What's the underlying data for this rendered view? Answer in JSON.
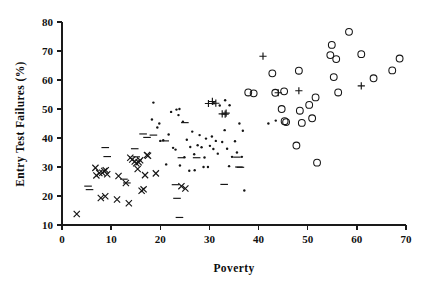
{
  "chart_data": {
    "type": "scatter",
    "title": "",
    "xlabel": "Poverty",
    "ylabel": "Entry Test Failures (%)",
    "xlim": [
      0,
      70
    ],
    "ylim": [
      10,
      80
    ],
    "xticks": [
      0,
      10,
      20,
      30,
      40,
      50,
      60,
      70
    ],
    "yticks": [
      10,
      20,
      30,
      40,
      50,
      60,
      70,
      80
    ],
    "xtick_labels": [
      "0",
      "10",
      "20",
      "30",
      "40",
      "50",
      "60",
      "70"
    ],
    "ytick_labels": [
      "10",
      "20",
      "30",
      "40",
      "50",
      "60",
      "70",
      "80"
    ],
    "grid": false,
    "legend": "none",
    "series": [
      {
        "name": "cross-group",
        "marker": "x",
        "values": [
          [
            3.0,
            13.8
          ],
          [
            6.8,
            29.7
          ],
          [
            7.0,
            27.1
          ],
          [
            7.6,
            27.9
          ],
          [
            7.9,
            19.3
          ],
          [
            8.2,
            28.0
          ],
          [
            8.6,
            28.6
          ],
          [
            8.8,
            19.9
          ],
          [
            8.9,
            28.9
          ],
          [
            9.2,
            27.5
          ],
          [
            11.2,
            18.8
          ],
          [
            11.5,
            26.9
          ],
          [
            13.0,
            24.5
          ],
          [
            13.6,
            17.5
          ],
          [
            13.9,
            33.2
          ],
          [
            14.3,
            32.6
          ],
          [
            14.8,
            31.9
          ],
          [
            15.1,
            31.3
          ],
          [
            15.4,
            29.3
          ],
          [
            15.6,
            31.6
          ],
          [
            15.9,
            32.3
          ],
          [
            16.2,
            21.8
          ],
          [
            16.6,
            22.3
          ],
          [
            16.9,
            27.2
          ],
          [
            17.3,
            34.1
          ],
          [
            17.5,
            33.9
          ],
          [
            19.1,
            27.8
          ],
          [
            25.1,
            22.6
          ],
          [
            24.3,
            23.4
          ]
        ]
      },
      {
        "name": "dash-group",
        "marker": "dash",
        "values": [
          [
            5.3,
            23.4
          ],
          [
            5.6,
            22.2
          ],
          [
            8.8,
            36.7
          ],
          [
            9.2,
            33.6
          ],
          [
            12.6,
            25.8
          ],
          [
            13.2,
            24.5
          ],
          [
            14.8,
            36.3
          ],
          [
            15.1,
            33.5
          ],
          [
            16.5,
            41.4
          ],
          [
            17.3,
            40.2
          ],
          [
            18.6,
            41.0
          ],
          [
            23.1,
            23.9
          ],
          [
            23.4,
            19.2
          ],
          [
            23.9,
            12.6
          ],
          [
            24.3,
            33.2
          ],
          [
            25.0,
            45.3
          ],
          [
            27.4,
            33.2
          ],
          [
            33.0,
            24.0
          ],
          [
            35.6,
            33.4
          ],
          [
            36.3,
            29.9
          ],
          [
            36.0,
            30.0
          ],
          [
            21.0,
            39.0
          ]
        ]
      },
      {
        "name": "dot-group",
        "marker": "dot",
        "values": [
          [
            18.6,
            52.2
          ],
          [
            18.3,
            46.4
          ],
          [
            19.4,
            43.6
          ],
          [
            20.0,
            39.0
          ],
          [
            20.6,
            39.2
          ],
          [
            21.2,
            30.9
          ],
          [
            21.7,
            41.2
          ],
          [
            22.6,
            36.6
          ],
          [
            23.3,
            49.8
          ],
          [
            23.7,
            47.9
          ],
          [
            23.9,
            50.0
          ],
          [
            24.6,
            45.6
          ],
          [
            24.9,
            33.4
          ],
          [
            25.4,
            39.4
          ],
          [
            25.9,
            28.7
          ],
          [
            26.5,
            42.2
          ],
          [
            26.9,
            34.4
          ],
          [
            27.6,
            37.5
          ],
          [
            28.0,
            41.0
          ],
          [
            28.4,
            36.8
          ],
          [
            28.8,
            30.0
          ],
          [
            29.3,
            39.8
          ],
          [
            29.7,
            30.0
          ],
          [
            30.1,
            37.3
          ],
          [
            30.5,
            40.5
          ],
          [
            30.8,
            36.2
          ],
          [
            31.3,
            39.0
          ],
          [
            31.7,
            34.6
          ],
          [
            32.1,
            51.2
          ],
          [
            32.6,
            38.6
          ],
          [
            33.1,
            42.7
          ],
          [
            33.6,
            36.3
          ],
          [
            34.1,
            51.3
          ],
          [
            34.6,
            33.5
          ],
          [
            35.2,
            38.9
          ],
          [
            35.6,
            35.0
          ],
          [
            36.1,
            45.0
          ],
          [
            36.8,
            42.5
          ],
          [
            37.1,
            21.9
          ],
          [
            36.6,
            33.5
          ],
          [
            22.2,
            49.0
          ],
          [
            23.1,
            36.0
          ],
          [
            19.8,
            45.0
          ],
          [
            26.1,
            36.9
          ],
          [
            29.0,
            33.3
          ],
          [
            30.9,
            52.0
          ],
          [
            33.2,
            53.0
          ],
          [
            34.0,
            30.3
          ],
          [
            24.0,
            30.5
          ],
          [
            27.0,
            28.9
          ],
          [
            42.0,
            45.0
          ],
          [
            43.5,
            46.0
          ]
        ]
      },
      {
        "name": "plus-group",
        "marker": "plus",
        "values": [
          [
            29.8,
            51.9
          ],
          [
            30.6,
            52.6
          ],
          [
            31.3,
            52.0
          ],
          [
            32.6,
            48.3
          ],
          [
            33.2,
            48.2
          ],
          [
            33.4,
            48.6
          ],
          [
            40.9,
            68.2
          ],
          [
            44.0,
            55.6
          ],
          [
            48.2,
            56.3
          ],
          [
            60.9,
            58.0
          ]
        ]
      },
      {
        "name": "circle-group",
        "marker": "circle",
        "values": [
          [
            37.9,
            55.7
          ],
          [
            39.0,
            55.4
          ],
          [
            42.8,
            62.3
          ],
          [
            43.4,
            55.6
          ],
          [
            44.7,
            50.0
          ],
          [
            45.3,
            45.8
          ],
          [
            45.6,
            45.5
          ],
          [
            45.2,
            56.1
          ],
          [
            47.7,
            37.4
          ],
          [
            48.2,
            63.2
          ],
          [
            48.4,
            49.4
          ],
          [
            48.8,
            45.2
          ],
          [
            50.3,
            51.4
          ],
          [
            50.9,
            46.8
          ],
          [
            51.6,
            54.0
          ],
          [
            51.9,
            31.5
          ],
          [
            54.6,
            68.6
          ],
          [
            54.9,
            72.1
          ],
          [
            55.3,
            61.0
          ],
          [
            55.8,
            67.2
          ],
          [
            56.2,
            55.7
          ],
          [
            58.4,
            76.6
          ],
          [
            60.9,
            68.9
          ],
          [
            63.4,
            60.6
          ],
          [
            67.2,
            63.3
          ],
          [
            68.7,
            67.4
          ]
        ]
      }
    ]
  },
  "axes": {
    "x_title": "Poverty",
    "y_title": "Entry Test Failures (%)"
  }
}
